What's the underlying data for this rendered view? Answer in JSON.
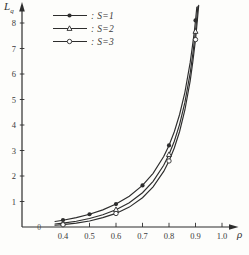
{
  "figure": {
    "ink": "#2d2d2d",
    "background": "#fdfdfb",
    "axis": {
      "ylabel_main": "L",
      "ylabel_sub": "q",
      "xlabel": "ρ",
      "origin_label": "0"
    },
    "legend": [
      {
        "label": ": S=1",
        "marker": "filled-circle"
      },
      {
        "label": ": S=2",
        "marker": "open-triangle"
      },
      {
        "label": ": S=3",
        "marker": "open-circle"
      }
    ]
  },
  "chart_data": {
    "type": "line",
    "title": "",
    "xlabel": "ρ",
    "ylabel": "Lq",
    "xlim": [
      0.35,
      1.05
    ],
    "ylim": [
      0,
      8.8
    ],
    "grid": false,
    "legend_position": "top-left",
    "x_tick_labels": [
      "0.4",
      "0.5",
      "0.6",
      "0.7",
      "0.8",
      "0.9",
      "1.0"
    ],
    "x_tick_values": [
      0.4,
      0.5,
      0.6,
      0.7,
      0.8,
      0.9,
      1.0
    ],
    "y_tick_labels": [
      "1",
      "2",
      "3",
      "4",
      "5",
      "6",
      "7",
      "8"
    ],
    "y_tick_values": [
      1,
      2,
      3,
      4,
      5,
      6,
      7,
      8
    ],
    "categories": [
      0.4,
      0.5,
      0.6,
      0.7,
      0.8,
      0.9
    ],
    "series": [
      {
        "id": "s1",
        "name": "S=1",
        "marker": "filled-circle",
        "values": [
          0.27,
          0.5,
          0.9,
          1.63,
          3.2,
          8.1
        ],
        "marker_x": [
          0.4,
          0.5,
          0.6,
          0.7,
          0.8,
          0.9
        ],
        "curve": [
          [
            0.37,
            0.217
          ],
          [
            0.4,
            0.267
          ],
          [
            0.45,
            0.368
          ],
          [
            0.5,
            0.5
          ],
          [
            0.55,
            0.672
          ],
          [
            0.6,
            0.9
          ],
          [
            0.65,
            1.207
          ],
          [
            0.7,
            1.633
          ],
          [
            0.74,
            2.106
          ],
          [
            0.78,
            2.765
          ],
          [
            0.8,
            3.2
          ],
          [
            0.82,
            3.736
          ],
          [
            0.84,
            4.41
          ],
          [
            0.86,
            5.283
          ],
          [
            0.88,
            6.453
          ],
          [
            0.89,
            7.201
          ],
          [
            0.895,
            7.629
          ],
          [
            0.9,
            8.1
          ],
          [
            0.905,
            8.62
          ]
        ]
      },
      {
        "id": "s2",
        "name": "S=2",
        "marker": "open-triangle",
        "values": [
          0.15,
          0.33,
          0.68,
          1.35,
          2.84,
          7.67
        ],
        "marker_x": [
          0.4,
          0.6,
          0.8,
          0.9
        ],
        "curve": [
          [
            0.37,
            0.117
          ],
          [
            0.4,
            0.152
          ],
          [
            0.45,
            0.229
          ],
          [
            0.5,
            0.333
          ],
          [
            0.55,
            0.477
          ],
          [
            0.6,
            0.675
          ],
          [
            0.65,
            0.951
          ],
          [
            0.7,
            1.345
          ],
          [
            0.74,
            1.791
          ],
          [
            0.78,
            2.424
          ],
          [
            0.8,
            2.844
          ],
          [
            0.82,
            3.366
          ],
          [
            0.84,
            4.027
          ],
          [
            0.86,
            4.885
          ],
          [
            0.88,
            6.042
          ],
          [
            0.89,
            6.782
          ],
          [
            0.9,
            7.674
          ],
          [
            0.905,
            8.19
          ],
          [
            0.909,
            8.65
          ]
        ]
      },
      {
        "id": "s3",
        "name": "S=3",
        "marker": "open-circle",
        "values": [
          0.09,
          0.24,
          0.53,
          1.15,
          2.59,
          7.35
        ],
        "marker_x": [
          0.4,
          0.6,
          0.8,
          0.9
        ],
        "curve": [
          [
            0.37,
            0.069
          ],
          [
            0.4,
            0.094
          ],
          [
            0.45,
            0.152
          ],
          [
            0.5,
            0.237
          ],
          [
            0.55,
            0.367
          ],
          [
            0.6,
            0.532
          ],
          [
            0.65,
            0.782
          ],
          [
            0.7,
            1.149
          ],
          [
            0.74,
            1.572
          ],
          [
            0.78,
            2.18
          ],
          [
            0.8,
            2.589
          ],
          [
            0.82,
            3.098
          ],
          [
            0.84,
            3.745
          ],
          [
            0.86,
            4.59
          ],
          [
            0.88,
            5.73
          ],
          [
            0.89,
            6.47
          ],
          [
            0.9,
            7.35
          ],
          [
            0.905,
            7.87
          ],
          [
            0.912,
            8.69
          ]
        ]
      }
    ]
  }
}
